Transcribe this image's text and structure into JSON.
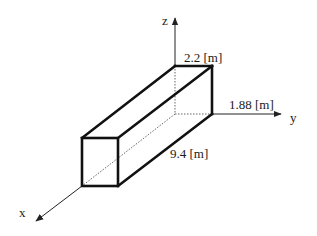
{
  "diagram": {
    "type": "3d-box-dimensions",
    "axes": {
      "x": {
        "label": "x"
      },
      "y": {
        "label": "y"
      },
      "z": {
        "label": "z"
      }
    },
    "dimensions": {
      "height": {
        "label": "2.2 [m]",
        "value": 2.2,
        "unit": "m",
        "axis": "z"
      },
      "width": {
        "label": "1.88 [m]",
        "value": 1.88,
        "unit": "m",
        "axis": "y"
      },
      "length": {
        "label": "9.4 [m]",
        "value": 9.4,
        "unit": "m",
        "axis": "x"
      }
    },
    "colors": {
      "edge": "#111111",
      "axis": "#222222",
      "hidden": "#555555",
      "background": "#ffffff"
    }
  }
}
